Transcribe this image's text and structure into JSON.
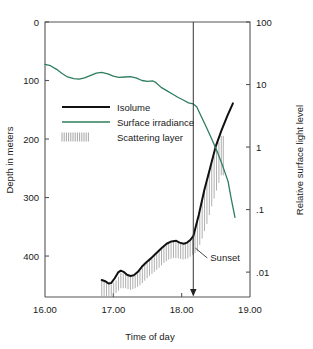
{
  "chart_data": {
    "type": "line",
    "title": "",
    "xlabel": "Time of day",
    "ylabel": "Depth in meters",
    "y2label": "Relative surface light level",
    "grid": false,
    "legend_position": "upper-left-inside",
    "xlim": [
      16.0,
      19.0
    ],
    "xticks": [
      "16.00",
      "17.00",
      "18.00",
      "19.00"
    ],
    "xtick_values": [
      16.0,
      17.0,
      18.0,
      19.0
    ],
    "ylim": [
      0,
      470
    ],
    "yticks": [
      "0",
      "100",
      "200",
      "300",
      "400"
    ],
    "ytick_values": [
      0,
      100,
      200,
      300,
      400
    ],
    "y2_scale": "log",
    "y2lim": [
      0.004,
      100
    ],
    "y2ticks": [
      "100",
      "10",
      "1",
      ".1",
      ".01"
    ],
    "y2tick_values": [
      100,
      10,
      1,
      0.1,
      0.01
    ],
    "annotations": [
      {
        "label": "Sunset",
        "x": 18.17,
        "type": "vertical-line-with-arrow"
      }
    ],
    "series": [
      {
        "name": "Isolume",
        "color": "#111111",
        "axis": "left",
        "points": [
          [
            16.83,
            441
          ],
          [
            16.88,
            443
          ],
          [
            16.93,
            447
          ],
          [
            16.97,
            446
          ],
          [
            17.02,
            438
          ],
          [
            17.07,
            428
          ],
          [
            17.11,
            425
          ],
          [
            17.15,
            427
          ],
          [
            17.2,
            432
          ],
          [
            17.25,
            434
          ],
          [
            17.3,
            433
          ],
          [
            17.36,
            427
          ],
          [
            17.42,
            418
          ],
          [
            17.48,
            411
          ],
          [
            17.55,
            404
          ],
          [
            17.62,
            396
          ],
          [
            17.7,
            387
          ],
          [
            17.78,
            379
          ],
          [
            17.85,
            375
          ],
          [
            17.92,
            374
          ],
          [
            17.97,
            377
          ],
          [
            18.03,
            379
          ],
          [
            18.08,
            377
          ],
          [
            18.13,
            372
          ],
          [
            18.17,
            366
          ],
          [
            18.25,
            330
          ],
          [
            18.33,
            288
          ],
          [
            18.42,
            248
          ],
          [
            18.5,
            212
          ],
          [
            18.58,
            186
          ],
          [
            18.67,
            160
          ],
          [
            18.75,
            139
          ]
        ]
      },
      {
        "name": "Surface irradiance",
        "color": "#2e7d5e",
        "axis": "right",
        "points": [
          [
            16.0,
            21.0
          ],
          [
            16.08,
            20.0
          ],
          [
            16.17,
            17.5
          ],
          [
            16.25,
            15.0
          ],
          [
            16.33,
            13.2
          ],
          [
            16.42,
            12.4
          ],
          [
            16.5,
            12.2
          ],
          [
            16.58,
            12.8
          ],
          [
            16.67,
            14.0
          ],
          [
            16.75,
            15.2
          ],
          [
            16.83,
            15.6
          ],
          [
            16.92,
            14.8
          ],
          [
            17.0,
            13.6
          ],
          [
            17.08,
            13.0
          ],
          [
            17.17,
            13.2
          ],
          [
            17.25,
            13.4
          ],
          [
            17.33,
            12.8
          ],
          [
            17.42,
            11.6
          ],
          [
            17.5,
            11.2
          ],
          [
            17.58,
            11.4
          ],
          [
            17.62,
            10.8
          ],
          [
            17.7,
            9.0
          ],
          [
            17.78,
            8.0
          ],
          [
            17.87,
            7.0
          ],
          [
            17.95,
            6.2
          ],
          [
            18.03,
            5.6
          ],
          [
            18.1,
            5.1
          ],
          [
            18.17,
            4.9
          ],
          [
            18.22,
            4.4
          ],
          [
            18.28,
            3.2
          ],
          [
            18.36,
            2.1
          ],
          [
            18.44,
            1.35
          ],
          [
            18.52,
            0.85
          ],
          [
            18.6,
            0.5
          ],
          [
            18.68,
            0.28
          ],
          [
            18.72,
            0.16
          ],
          [
            18.78,
            0.075
          ]
        ]
      }
    ],
    "scattering_layer": {
      "name": "Scattering layer",
      "color": "#9a9a9a",
      "description": "vertical hatch band below the isolume",
      "band": [
        [
          16.83,
          441,
          470
        ],
        [
          16.9,
          444,
          470
        ],
        [
          16.97,
          447,
          468
        ],
        [
          17.04,
          440,
          463
        ],
        [
          17.11,
          427,
          455
        ],
        [
          17.18,
          429,
          455
        ],
        [
          17.25,
          434,
          458
        ],
        [
          17.32,
          432,
          455
        ],
        [
          17.39,
          424,
          450
        ],
        [
          17.46,
          414,
          442
        ],
        [
          17.53,
          406,
          434
        ],
        [
          17.6,
          398,
          427
        ],
        [
          17.67,
          390,
          420
        ],
        [
          17.74,
          383,
          412
        ],
        [
          17.81,
          377,
          406
        ],
        [
          17.88,
          374,
          403
        ],
        [
          17.95,
          376,
          404
        ],
        [
          18.02,
          379,
          406
        ],
        [
          18.09,
          376,
          404
        ],
        [
          18.16,
          368,
          398
        ],
        [
          18.23,
          340,
          392
        ],
        [
          18.3,
          305,
          370
        ],
        [
          18.37,
          272,
          345
        ],
        [
          18.44,
          240,
          315
        ],
        [
          18.51,
          214,
          288
        ],
        [
          18.58,
          193,
          262
        ]
      ]
    }
  },
  "legend": {
    "items": [
      {
        "label": "Isolume",
        "marker": "solid-thick-black-line"
      },
      {
        "label": "Surface irradiance",
        "marker": "solid-green-line"
      },
      {
        "label": "Scattering layer",
        "marker": "vertical-hatch-swatch"
      }
    ]
  },
  "colors": {
    "isolume": "#111111",
    "irradiance": "#2e7d5e",
    "scattering": "#9a9a9a",
    "axis": "#555555",
    "text": "#1a1a1a"
  }
}
